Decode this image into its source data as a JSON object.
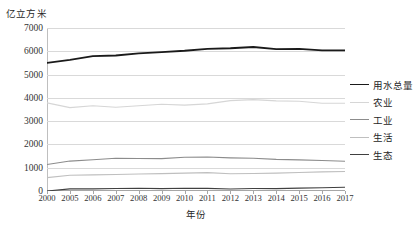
{
  "chart_data": {
    "type": "line",
    "title": "",
    "xlabel": "年份",
    "ylabel": "亿立方米",
    "categories": [
      "2000",
      "2005",
      "2006",
      "2007",
      "2008",
      "2009",
      "2010",
      "2011",
      "2012",
      "2013",
      "2014",
      "2015",
      "2016",
      "2017"
    ],
    "ylim": [
      0,
      7000
    ],
    "yticks": [
      0,
      1000,
      2000,
      3000,
      4000,
      5000,
      6000,
      7000
    ],
    "grid": true,
    "legend_position": "right",
    "series": [
      {
        "name": "用水总量",
        "color": "#1a1a1a",
        "values": [
          5498,
          5633,
          5795,
          5819,
          5910,
          5965,
          6022,
          6107,
          6131,
          6183,
          6095,
          6103,
          6040,
          6043
        ]
      },
      {
        "name": "农业",
        "color": "#d6d6d6",
        "values": [
          3784,
          3580,
          3664,
          3599,
          3664,
          3723,
          3689,
          3743,
          3880,
          3922,
          3869,
          3852,
          3768,
          3766
        ]
      },
      {
        "name": "工业",
        "color": "#8c8c8c",
        "values": [
          1139,
          1285,
          1344,
          1404,
          1397,
          1391,
          1447,
          1462,
          1423,
          1406,
          1356,
          1335,
          1308,
          1277
        ]
      },
      {
        "name": "生活",
        "color": "#bfbfbf",
        "values": [
          575,
          675,
          694,
          710,
          729,
          748,
          766,
          790,
          740,
          750,
          767,
          794,
          822,
          838
        ]
      },
      {
        "name": "生态",
        "color": "#404040",
        "values": [
          0,
          93,
          93,
          106,
          120,
          103,
          120,
          112,
          88,
          105,
          103,
          122,
          142,
          162
        ]
      }
    ]
  },
  "ytick_labels": [
    "7000",
    "6000",
    "5000",
    "4000",
    "3000",
    "2000",
    "1000",
    "0"
  ],
  "axis": {
    "y_unit_caption": "亿立方米",
    "x_axis_title": "年份"
  }
}
